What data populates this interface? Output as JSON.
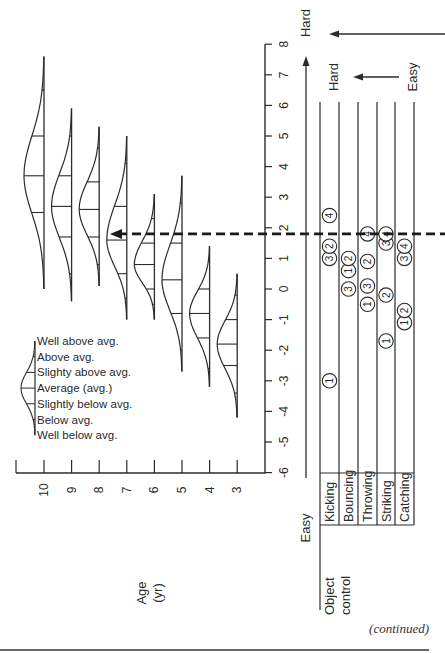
{
  "chart_data": {
    "type": "line",
    "title": "",
    "orientation_note": "Figure rotated 90 degrees counter-clockwise",
    "xlabel": "Age (yr)",
    "ylabel": "Difficulty (Easy to Hard)",
    "x_ticks": [
      "10",
      "9",
      "8",
      "7",
      "6",
      "5",
      "4",
      "3"
    ],
    "y_ticks": [
      "8",
      "7",
      "6",
      "5",
      "4",
      "3",
      "2",
      "1",
      "0",
      "-1",
      "-2",
      "-3",
      "-4",
      "-5",
      "-6"
    ],
    "ylim": [
      -6,
      8
    ],
    "reference_line": {
      "value": 1.8,
      "style": "dashed",
      "arrow": "toward age 7 curve"
    },
    "age_distributions": [
      {
        "age": 10,
        "avg": 3.7,
        "min": 0.0,
        "max": 7.6,
        "levels": [
          0.0,
          0.5,
          2.5,
          3.7,
          5.0,
          6.5,
          7.6
        ]
      },
      {
        "age": 9,
        "avg": 2.7,
        "min": -0.4,
        "max": 5.9,
        "levels": [
          -0.4,
          0.5,
          1.7,
          2.7,
          3.7,
          5.0,
          5.9
        ]
      },
      {
        "age": 8,
        "avg": 2.6,
        "min": 0.1,
        "max": 5.3,
        "levels": [
          0.1,
          0.8,
          1.7,
          2.6,
          3.5,
          4.6,
          5.3
        ]
      },
      {
        "age": 7,
        "avg": 1.6,
        "min": -1.0,
        "max": 5.0,
        "levels": [
          -1.0,
          -0.3,
          0.5,
          1.6,
          2.7,
          4.1,
          5.0
        ]
      },
      {
        "age": 6,
        "avg": 0.8,
        "min": -1.0,
        "max": 3.1,
        "levels": [
          -1.0,
          -0.5,
          0.0,
          0.8,
          1.5,
          2.3,
          3.1
        ]
      },
      {
        "age": 5,
        "avg": 0.3,
        "min": -2.7,
        "max": 3.7,
        "levels": [
          -2.7,
          -2.0,
          -0.8,
          0.3,
          1.5,
          2.8,
          3.7
        ]
      },
      {
        "age": 4,
        "avg": -0.8,
        "min": -3.2,
        "max": 1.4,
        "levels": [
          -3.2,
          -2.6,
          -1.6,
          -0.8,
          0.0,
          0.9,
          1.4
        ]
      },
      {
        "age": 3,
        "avg": -1.8,
        "min": -4.2,
        "max": 0.5,
        "levels": [
          -4.2,
          -3.4,
          -2.5,
          -1.8,
          -1.0,
          -0.2,
          0.5
        ]
      }
    ],
    "skill_category": "Object control",
    "skills": [
      {
        "name": "Kicking",
        "items": [
          {
            "n": "1",
            "v": -3.0
          },
          {
            "n": "3",
            "v": 1.0
          },
          {
            "n": "2",
            "v": 1.4
          },
          {
            "n": "4",
            "v": 2.4
          }
        ]
      },
      {
        "name": "Bouncing",
        "items": [
          {
            "n": "3",
            "v": 0.0
          },
          {
            "n": "1",
            "v": 0.6
          },
          {
            "n": "2",
            "v": 1.0
          }
        ]
      },
      {
        "name": "Throwing",
        "items": [
          {
            "n": "1",
            "v": -0.5
          },
          {
            "n": "3",
            "v": 0.1
          },
          {
            "n": "2",
            "v": 0.9
          },
          {
            "n": "4",
            "v": 1.8
          }
        ]
      },
      {
        "name": "Striking",
        "items": [
          {
            "n": "1",
            "v": -1.7
          },
          {
            "n": "2",
            "v": -0.2
          },
          {
            "n": "3",
            "v": 1.5
          },
          {
            "n": "4",
            "v": 1.8
          }
        ]
      },
      {
        "name": "Catching",
        "items": [
          {
            "n": "1",
            "v": -1.1
          },
          {
            "n": "2",
            "v": -0.7
          },
          {
            "n": "3",
            "v": 1.0
          },
          {
            "n": "4",
            "v": 1.4
          }
        ]
      }
    ],
    "legend": [
      "Well above avg.",
      "Above avg.",
      "Slighty above avg.",
      "Average (avg.)",
      "Slightly below avg.",
      "Below avg.",
      "Well below avg."
    ]
  },
  "labels": {
    "age_axis": "Age",
    "age_unit": "(yr)",
    "hard_main": "Hard",
    "easy_main": "Easy",
    "hard_sub": "Hard",
    "easy_sub": "Easy",
    "category": "Object",
    "category2": "control",
    "continued": "(continued)"
  }
}
